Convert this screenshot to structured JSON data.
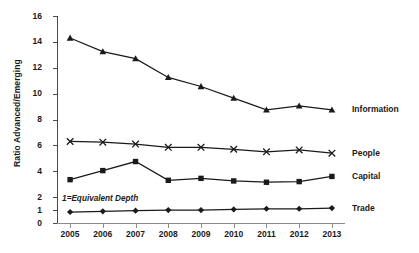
{
  "chart_data": {
    "type": "line",
    "title": "",
    "xlabel": "",
    "ylabel": "Ratio Advanced/Emerging",
    "categories": [
      "2005",
      "2006",
      "2007",
      "2008",
      "2009",
      "2010",
      "2011",
      "2012",
      "2013"
    ],
    "x": [
      2005,
      2006,
      2007,
      2008,
      2009,
      2010,
      2011,
      2012,
      2013
    ],
    "ylim": [
      0,
      16
    ],
    "xlim": [
      2004.6,
      2013.4
    ],
    "yticks": [
      0,
      1,
      2,
      4,
      6,
      8,
      10,
      12,
      14,
      16
    ],
    "ytick_labels": [
      "0",
      "1",
      "2",
      "4",
      "6",
      "8",
      "10",
      "12",
      "14",
      "16"
    ],
    "grid": false,
    "legend_position": "right-inline",
    "series": [
      {
        "name": "Information",
        "marker": "triangle",
        "color": "#1a1a1a",
        "values": [
          14.3,
          13.25,
          12.7,
          11.25,
          10.55,
          9.65,
          8.75,
          9.05,
          8.75
        ]
      },
      {
        "name": "People",
        "marker": "cross-x",
        "color": "#1a1a1a",
        "values": [
          6.3,
          6.25,
          6.1,
          5.85,
          5.85,
          5.7,
          5.5,
          5.65,
          5.4
        ]
      },
      {
        "name": "Capital",
        "marker": "square",
        "color": "#1a1a1a",
        "values": [
          3.35,
          4.05,
          4.75,
          3.3,
          3.45,
          3.25,
          3.15,
          3.2,
          3.6
        ]
      },
      {
        "name": "Trade",
        "marker": "diamond",
        "color": "#1a1a1a",
        "values": [
          0.85,
          0.9,
          0.95,
          1.0,
          1.0,
          1.05,
          1.1,
          1.1,
          1.15
        ]
      }
    ],
    "annotations": [
      {
        "text": "1=Equivalent Depth",
        "x": 2005.0,
        "y": 1.75,
        "style": "italic"
      }
    ]
  },
  "axis": {
    "y_title": "Ratio Advanced/Emerging"
  },
  "colors": {
    "ink": "#1a1a1a",
    "line": "#2b2b2b",
    "axis": "#4a4a4a",
    "axis_x": "#8c8c8c",
    "background": "#ffffff"
  }
}
